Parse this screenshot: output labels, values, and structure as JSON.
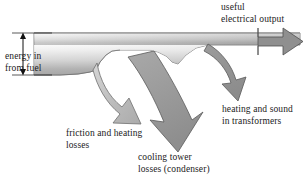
{
  "diagram": {
    "type": "sankey-energy-flow",
    "title": "",
    "palette": {
      "background": "#ffffff",
      "band_light": "#f2f2f2",
      "band_mid": "#bdbdbd",
      "band_dark": "#8f8f8f",
      "arrow_fill": "#8f8f8f",
      "arrow_fill_light": "#b0b0b0",
      "outline": "#4a4a4a",
      "text": "#1b1b1b",
      "dimension_line": "#111111"
    },
    "flows": [
      {
        "id": "energy-in",
        "label_lines": [
          "energy in",
          "from fuel"
        ],
        "direction": "right",
        "role": "input"
      },
      {
        "id": "useful-electrical-output",
        "label_lines": [
          "useful",
          "electrical output"
        ],
        "direction": "right",
        "role": "useful-output"
      },
      {
        "id": "friction-and-heating-losses",
        "label_lines": [
          "friction and heating",
          "losses"
        ],
        "direction": "down",
        "role": "loss"
      },
      {
        "id": "cooling-tower-losses",
        "label_lines": [
          "cooling tower",
          "losses (condenser)"
        ],
        "direction": "down",
        "role": "loss"
      },
      {
        "id": "heating-and-sound-in-transformers",
        "label_lines": [
          "heating and sound",
          "in transformers"
        ],
        "direction": "down",
        "role": "loss"
      }
    ],
    "labels": {
      "useful_electrical_output_line1": "useful",
      "useful_electrical_output_line2": "electrical output",
      "energy_in_line1": "energy in",
      "energy_in_line2": "from fuel",
      "friction_losses_line1": "friction and heating",
      "friction_losses_line2": "losses",
      "cooling_tower_line1": "cooling tower",
      "cooling_tower_line2": "losses (condenser)",
      "transformers_line1": "heating and sound",
      "transformers_line2": "in transformers"
    },
    "annotations": {
      "energy_in_bracket": "vertical double-headed dimension arrow spanning the full height of the input band"
    }
  }
}
